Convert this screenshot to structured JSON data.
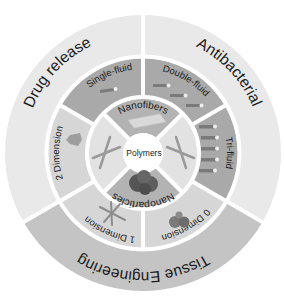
{
  "center": {
    "label": "Polymers"
  },
  "inner_ring": [
    {
      "label": "Nanofibers",
      "kind": "labeled"
    },
    {
      "label": "",
      "kind": "icon",
      "icon": "fiber-cross-icon"
    },
    {
      "label": "Nanoparticles",
      "kind": "labeled"
    },
    {
      "label": "",
      "kind": "icon",
      "icon": "fiber-cross-icon"
    }
  ],
  "middle_ring": [
    {
      "label": "Double-fluid"
    },
    {
      "label": "Single-fluid"
    },
    {
      "label": "2 Dimension"
    },
    {
      "label": "1 Dimension"
    },
    {
      "label": "0 Dimension"
    },
    {
      "label": "Tri-fluid"
    }
  ],
  "outer_ring": [
    {
      "label": "Antibacterial"
    },
    {
      "label": "Drug release"
    },
    {
      "label": "Tissue Engineering"
    }
  ],
  "colors": {
    "outer_light": "#e9e9e9",
    "outer_dark": "#c4c4c4",
    "middle_dark": "#a9a9a9",
    "middle_light": "#d6d6d6",
    "inner_dark": "#b3b3b3",
    "inner_light": "#e2e2e2",
    "center": "#ffffff",
    "divider": "#ffffff"
  }
}
